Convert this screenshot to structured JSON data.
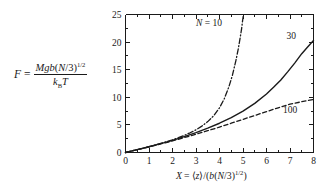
{
  "figure": {
    "background_color": "#ffffff",
    "ink_color": "#1a1a1a"
  },
  "formula": {
    "lhs": "F",
    "equals": "=",
    "numerator_plain": "Mgb(N/3)1/2",
    "denominator_plain": "kBT",
    "num_M": "M",
    "num_g": "g",
    "num_b": "b",
    "num_open": "(",
    "num_N": "N",
    "num_slash3": "/3)",
    "num_exp": "1/2",
    "den_k": "k",
    "den_B": "B",
    "den_T": "T"
  },
  "axes": {
    "x_title_parts": {
      "X": "X",
      "equals": "=",
      "bra": "⟨",
      "z": "z",
      "ket": "⟩",
      "slash_open": "/(",
      "b": "b",
      "open": "(",
      "N": "N",
      "slash3": "/3)",
      "exp": "1/2",
      "close": ")"
    },
    "x_title_plain": "X = ⟨z⟩/(b(N/3)1/2)",
    "y_title_plain": "F = Mgb(N/3)1/2 / kBT",
    "x_ticks": [
      "0",
      "1",
      "2",
      "3",
      "4",
      "5",
      "6",
      "7",
      "8"
    ],
    "y_ticks": [
      "0",
      "5",
      "10",
      "15",
      "20",
      "25"
    ],
    "x_minor_per_interval": 1,
    "y_minor_per_interval": 1
  },
  "chart_data": {
    "type": "line",
    "title": "",
    "xlabel": "X = ⟨z⟩/(b(N/3)^(1/2))",
    "ylabel": "F = Mgb(N/3)^(1/2)/(k_B T)",
    "xlim": [
      0,
      8
    ],
    "ylim": [
      0,
      25
    ],
    "xticks": [
      0,
      1,
      2,
      3,
      4,
      5,
      6,
      7,
      8
    ],
    "yticks": [
      0,
      5,
      10,
      15,
      20,
      25
    ],
    "grid": false,
    "legend": "inline-labels",
    "series": [
      {
        "name": "N = 10",
        "label": "N = 10",
        "label_x": 3.55,
        "label_y": 23.0,
        "style": "dash-dot",
        "color": "#1a1a1a",
        "width": 1.3,
        "x": [
          0.0,
          0.25,
          0.5,
          0.75,
          1.0,
          1.25,
          1.5,
          1.75,
          2.0,
          2.25,
          2.5,
          2.75,
          3.0,
          3.25,
          3.5,
          3.75,
          4.0,
          4.2,
          4.4,
          4.55,
          4.7,
          4.8,
          4.88,
          4.94,
          4.98,
          5.02
        ],
        "y": [
          0.0,
          0.26,
          0.52,
          0.79,
          1.06,
          1.35,
          1.65,
          1.96,
          2.3,
          2.68,
          3.1,
          3.57,
          4.12,
          4.78,
          5.6,
          6.65,
          8.1,
          9.7,
          11.9,
          14.0,
          16.7,
          18.8,
          20.8,
          22.4,
          23.8,
          25.0
        ]
      },
      {
        "name": "30",
        "label": "30",
        "label_x": 7.05,
        "label_y": 20.6,
        "style": "solid",
        "color": "#1a1a1a",
        "width": 1.4,
        "x": [
          0.0,
          0.5,
          1.0,
          1.5,
          2.0,
          2.5,
          3.0,
          3.5,
          4.0,
          4.5,
          5.0,
          5.5,
          6.0,
          6.3,
          6.6,
          6.9,
          7.2,
          7.5,
          7.75,
          8.0
        ],
        "y": [
          0.0,
          0.52,
          1.04,
          1.6,
          2.2,
          2.88,
          3.6,
          4.4,
          5.3,
          6.3,
          7.5,
          8.9,
          10.6,
          11.8,
          13.1,
          14.6,
          16.2,
          17.9,
          19.1,
          20.3
        ]
      },
      {
        "name": "100",
        "label": "100",
        "label_x": 7.0,
        "label_y": 7.1,
        "style": "dashed",
        "color": "#1a1a1a",
        "width": 1.3,
        "x": [
          0.0,
          0.5,
          1.0,
          1.5,
          2.0,
          2.5,
          3.0,
          3.5,
          4.0,
          4.5,
          5.0,
          5.5,
          6.0,
          6.5,
          7.0,
          7.5,
          8.0
        ],
        "y": [
          0.0,
          0.5,
          1.0,
          1.55,
          2.1,
          2.7,
          3.3,
          3.95,
          4.6,
          5.3,
          6.0,
          6.7,
          7.4,
          8.1,
          8.75,
          9.2,
          9.6
        ]
      }
    ]
  }
}
